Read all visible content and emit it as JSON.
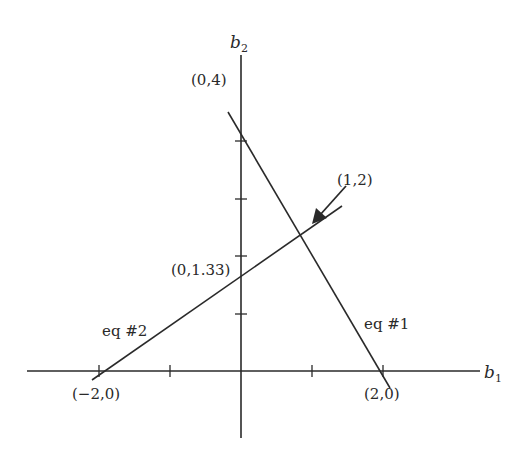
{
  "diagram": {
    "type": "line-intersection",
    "axes": {
      "x_label": "b",
      "x_sub": "1",
      "y_label": "b",
      "y_sub": "2"
    },
    "points": {
      "y_intercept_eq1": "(0,4)",
      "intersection": "(1,2)",
      "y_intercept_eq2": "(0,1.33)",
      "x_intercept_eq2": "(−2,0)",
      "x_intercept_eq1": "(2,0)"
    },
    "lines": [
      {
        "name": "eq #1",
        "label": "eq #1",
        "from": [
          0,
          4
        ],
        "to": [
          2,
          0
        ]
      },
      {
        "name": "eq #2",
        "label": "eq #2",
        "from": [
          -2,
          0
        ],
        "to": [
          1,
          2
        ]
      }
    ],
    "colors": {
      "line": "#2a2a2a",
      "background": "#ffffff"
    }
  }
}
